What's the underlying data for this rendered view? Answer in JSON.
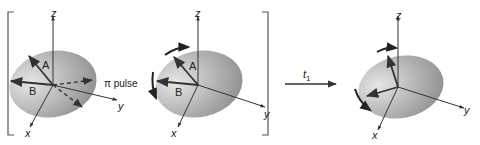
{
  "figure": {
    "panels": [
      {
        "id": "before-pulse",
        "axes": {
          "z": "z",
          "y": "y",
          "x": "x"
        },
        "vectors": [
          {
            "label": "A"
          },
          {
            "label": "B"
          }
        ],
        "annotation": "π pulse"
      },
      {
        "id": "after-pulse",
        "axes": {
          "z": "z",
          "y": "y",
          "x": "x"
        },
        "vectors": [
          {
            "label": "A"
          },
          {
            "label": "B"
          }
        ]
      },
      {
        "id": "after-t1",
        "axes": {
          "z": "z",
          "y": "y",
          "x": "x"
        }
      }
    ],
    "transition": {
      "label": "t",
      "subscript": "1"
    },
    "colors": {
      "ellipse_light": "#e3e3e3",
      "ellipse_dark": "#8e8e8e",
      "line": "#333333",
      "bracket": "#555555"
    }
  }
}
